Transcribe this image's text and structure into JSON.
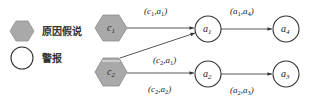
{
  "legend": {
    "hypothesis_label": "原因假说",
    "alarm_label": "警报"
  },
  "nodes": {
    "c1": {
      "base": "c",
      "sub": "1",
      "type": "hypothesis"
    },
    "c2": {
      "base": "c",
      "sub": "2",
      "type": "hypothesis"
    },
    "a1": {
      "base": "a",
      "sub": "1",
      "type": "alarm"
    },
    "a2": {
      "base": "a",
      "sub": "2",
      "type": "alarm"
    },
    "a3": {
      "base": "a",
      "sub": "3",
      "type": "alarm"
    },
    "a4": {
      "base": "a",
      "sub": "4",
      "type": "alarm"
    }
  },
  "edges": [
    {
      "from": "c1",
      "to": "a1",
      "label": {
        "open": "(",
        "b1": "c",
        "s1": "1",
        "sep": ",",
        "b2": "a",
        "s2": "1",
        "close": ")"
      }
    },
    {
      "from": "c2",
      "to": "a1",
      "label": {
        "open": "(",
        "b1": "c",
        "s1": "2",
        "sep": ",",
        "b2": "a",
        "s2": "1",
        "close": ")"
      }
    },
    {
      "from": "c2",
      "to": "a2",
      "label": {
        "open": "(",
        "b1": "c",
        "s1": "2",
        "sep": ",",
        "b2": "a",
        "s2": "2",
        "close": ")"
      }
    },
    {
      "from": "a1",
      "to": "a4",
      "label": {
        "open": "(",
        "b1": "a",
        "s1": "1",
        "sep": ",",
        "b2": "a",
        "s2": "4",
        "close": ")"
      }
    },
    {
      "from": "a2",
      "to": "a3",
      "label": {
        "open": "(",
        "b1": "a",
        "s1": "2",
        "sep": ",",
        "b2": "a",
        "s2": "3",
        "close": ")"
      }
    }
  ],
  "colors": {
    "hexagon_fill": "#a9a9a9",
    "hexagon_stroke": "#8a8a8a",
    "circle_stroke": "#333333",
    "edge": "#444444"
  }
}
